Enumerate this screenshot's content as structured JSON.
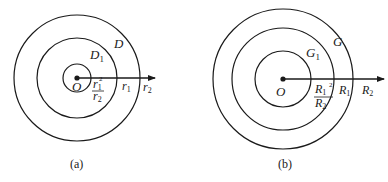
{
  "diagram_a": {
    "caption": "(a)",
    "center_label": "O",
    "outer_region_label": "D",
    "inner_region_label": "D",
    "inner_region_sub": "1",
    "inner_radius_num": "r",
    "inner_radius_num_sub": "1",
    "inner_radius_num_sup": "2",
    "inner_radius_den": "r",
    "inner_radius_den_sub": "2",
    "middle_radius_label": "r",
    "middle_radius_sub": "1",
    "outer_radius_label": "r",
    "outer_radius_sub": "2"
  },
  "diagram_b": {
    "caption": "(b)",
    "center_label": "O",
    "outer_region_label": "G",
    "inner_region_label": "G",
    "inner_region_sub": "1",
    "inner_radius_num": "R",
    "inner_radius_num_sub": "1",
    "inner_radius_num_sup": "2",
    "inner_radius_den": "R",
    "inner_radius_den_sub": "2",
    "middle_radius_label": "R",
    "middle_radius_sub": "1",
    "outer_radius_label": "R",
    "outer_radius_sub": "2"
  },
  "colors": {
    "stroke": "#1a1a1a",
    "background": "#ffffff"
  }
}
